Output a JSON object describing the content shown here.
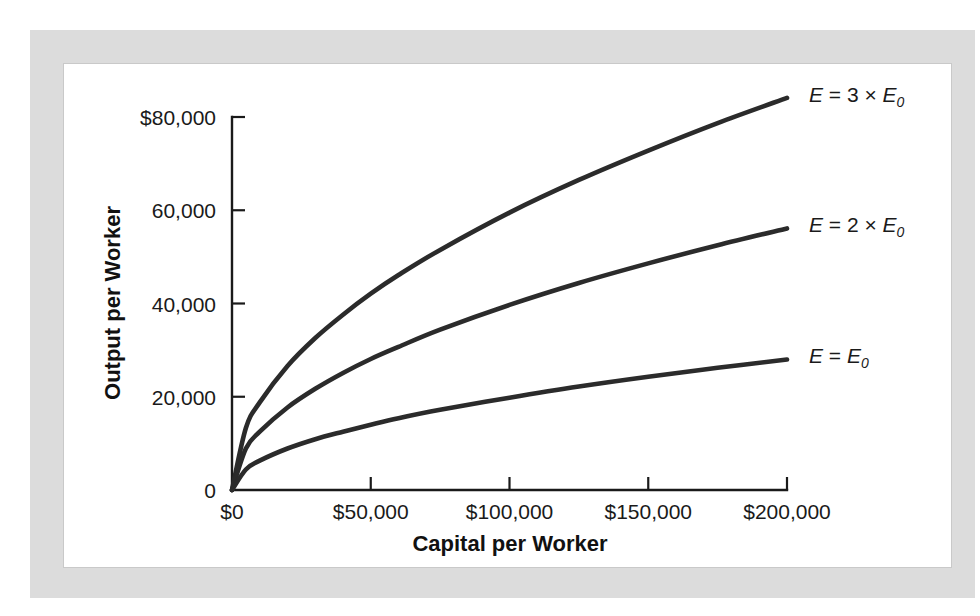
{
  "figure": {
    "background_color": "#ffffff",
    "frame_color": "#dcdcdc",
    "canvas_color": "#ffffff",
    "curve_color": "#2b2b2b",
    "axis_color": "#1a1a1a"
  },
  "chart_data": {
    "type": "line",
    "title": "",
    "subtitle": "",
    "xlabel": "Capital per Worker",
    "ylabel": "Output per Worker",
    "xlim": [
      0,
      200000
    ],
    "ylim": [
      0,
      85000
    ],
    "grid": false,
    "legend_position": "right-of-curve-ends",
    "xticks": [
      0,
      50000,
      100000,
      150000,
      200000
    ],
    "xtick_labels": [
      "$0",
      "$50,000",
      "$100,000",
      "$150,000",
      "$200,000"
    ],
    "yticks": [
      0,
      20000,
      40000,
      60000,
      80000
    ],
    "ytick_labels": [
      "0",
      "20,000",
      "40,000",
      "60,000",
      "80,000"
    ],
    "ytick_label_top": "$80,000",
    "series": [
      {
        "name": "E = 3 × E0",
        "label_parts": {
          "lhs": "E",
          "eq": "=",
          "coef": "3",
          "times": "×",
          "base": "E",
          "sub": "0"
        },
        "x": [
          0,
          5000,
          10000,
          20000,
          30000,
          40000,
          50000,
          60000,
          75000,
          100000,
          125000,
          150000,
          175000,
          200000
        ],
        "values": [
          0,
          13300,
          18800,
          26600,
          32600,
          37600,
          42100,
          46100,
          51500,
          59500,
          66500,
          72800,
          78700,
          84100
        ]
      },
      {
        "name": "E = 2 × E0",
        "label_parts": {
          "lhs": "E",
          "eq": "=",
          "coef": "2",
          "times": "×",
          "base": "E",
          "sub": "0"
        },
        "x": [
          0,
          5000,
          10000,
          20000,
          30000,
          40000,
          50000,
          60000,
          75000,
          100000,
          125000,
          150000,
          175000,
          200000
        ],
        "values": [
          0,
          8900,
          12500,
          17700,
          21700,
          25100,
          28100,
          30700,
          34400,
          39700,
          44400,
          48600,
          52500,
          56100
        ]
      },
      {
        "name": "E = E0",
        "label_parts": {
          "lhs": "E",
          "eq": "=",
          "coef": "",
          "times": "",
          "base": "E",
          "sub": "0"
        },
        "x": [
          0,
          5000,
          10000,
          20000,
          30000,
          40000,
          50000,
          60000,
          75000,
          100000,
          125000,
          150000,
          175000,
          200000
        ],
        "values": [
          0,
          4400,
          6300,
          8900,
          10900,
          12500,
          14000,
          15400,
          17200,
          19800,
          22200,
          24300,
          26200,
          28000
        ]
      }
    ]
  }
}
